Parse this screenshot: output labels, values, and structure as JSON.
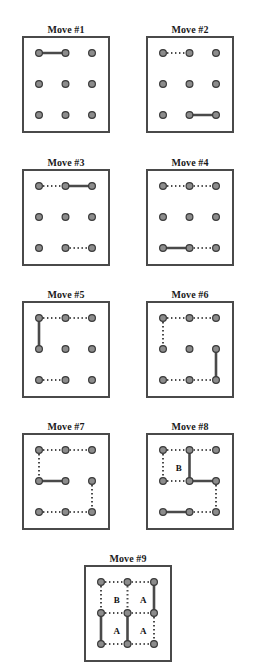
{
  "figure": {
    "type": "diagram",
    "grid_rows": 3,
    "grid_cols": 3,
    "colors": {
      "frame": "#4a4a4a",
      "dot_fill": "#8c8c8c",
      "dot_stroke": "#3a3a3a",
      "solid_line": "#4a4a4a",
      "dotted_line": "#4a4a4a",
      "label_text": "#111111",
      "background": "#ffffff"
    },
    "legend": {
      "solid_meaning": "edge drawn on this move",
      "dotted_meaning": "edge drawn on a previous move"
    }
  },
  "panels": [
    {
      "id": "move-1",
      "title": "Move #1",
      "x": 22,
      "y": 24,
      "width": 88,
      "height": 97,
      "solid_edges": [
        {
          "from": [
            0,
            0
          ],
          "to": [
            1,
            0
          ]
        }
      ],
      "dotted_edges": [],
      "labels": []
    },
    {
      "id": "move-2",
      "title": "Move #2",
      "x": 146,
      "y": 24,
      "width": 88,
      "height": 97,
      "solid_edges": [
        {
          "from": [
            1,
            2
          ],
          "to": [
            2,
            2
          ]
        }
      ],
      "dotted_edges": [
        {
          "from": [
            0,
            0
          ],
          "to": [
            1,
            0
          ]
        }
      ],
      "labels": []
    },
    {
      "id": "move-3",
      "title": "Move #3",
      "x": 22,
      "y": 157,
      "width": 88,
      "height": 97,
      "solid_edges": [
        {
          "from": [
            1,
            0
          ],
          "to": [
            2,
            0
          ]
        }
      ],
      "dotted_edges": [
        {
          "from": [
            0,
            0
          ],
          "to": [
            1,
            0
          ]
        },
        {
          "from": [
            1,
            2
          ],
          "to": [
            2,
            2
          ]
        }
      ],
      "labels": []
    },
    {
      "id": "move-4",
      "title": "Move #4",
      "x": 146,
      "y": 157,
      "width": 88,
      "height": 97,
      "solid_edges": [
        {
          "from": [
            0,
            2
          ],
          "to": [
            1,
            2
          ]
        }
      ],
      "dotted_edges": [
        {
          "from": [
            0,
            0
          ],
          "to": [
            1,
            0
          ]
        },
        {
          "from": [
            1,
            0
          ],
          "to": [
            2,
            0
          ]
        },
        {
          "from": [
            1,
            2
          ],
          "to": [
            2,
            2
          ]
        }
      ],
      "labels": []
    },
    {
      "id": "move-5",
      "title": "Move #5",
      "x": 22,
      "y": 289,
      "width": 88,
      "height": 97,
      "solid_edges": [
        {
          "from": [
            0,
            0
          ],
          "to": [
            0,
            1
          ]
        }
      ],
      "dotted_edges": [
        {
          "from": [
            0,
            0
          ],
          "to": [
            1,
            0
          ]
        },
        {
          "from": [
            1,
            0
          ],
          "to": [
            2,
            0
          ]
        },
        {
          "from": [
            0,
            2
          ],
          "to": [
            1,
            2
          ]
        }
      ],
      "labels": []
    },
    {
      "id": "move-6",
      "title": "Move #6",
      "x": 146,
      "y": 289,
      "width": 88,
      "height": 97,
      "solid_edges": [
        {
          "from": [
            2,
            1
          ],
          "to": [
            2,
            2
          ]
        }
      ],
      "dotted_edges": [
        {
          "from": [
            0,
            0
          ],
          "to": [
            1,
            0
          ]
        },
        {
          "from": [
            1,
            0
          ],
          "to": [
            2,
            0
          ]
        },
        {
          "from": [
            0,
            0
          ],
          "to": [
            0,
            1
          ]
        },
        {
          "from": [
            0,
            2
          ],
          "to": [
            1,
            2
          ]
        },
        {
          "from": [
            1,
            2
          ],
          "to": [
            2,
            2
          ]
        }
      ],
      "labels": []
    },
    {
      "id": "move-7",
      "title": "Move #7",
      "x": 22,
      "y": 421,
      "width": 88,
      "height": 97,
      "solid_edges": [
        {
          "from": [
            0,
            1
          ],
          "to": [
            1,
            1
          ]
        }
      ],
      "dotted_edges": [
        {
          "from": [
            0,
            0
          ],
          "to": [
            1,
            0
          ]
        },
        {
          "from": [
            1,
            0
          ],
          "to": [
            2,
            0
          ]
        },
        {
          "from": [
            0,
            0
          ],
          "to": [
            0,
            1
          ]
        },
        {
          "from": [
            2,
            1
          ],
          "to": [
            2,
            2
          ]
        },
        {
          "from": [
            0,
            2
          ],
          "to": [
            1,
            2
          ]
        },
        {
          "from": [
            1,
            2
          ],
          "to": [
            2,
            2
          ]
        }
      ],
      "labels": []
    },
    {
      "id": "move-8",
      "title": "Move #8",
      "x": 146,
      "y": 421,
      "width": 88,
      "height": 97,
      "solid_edges": [
        {
          "from": [
            1,
            0
          ],
          "to": [
            1,
            1
          ]
        },
        {
          "from": [
            1,
            1
          ],
          "to": [
            2,
            1
          ]
        },
        {
          "from": [
            0,
            2
          ],
          "to": [
            1,
            2
          ]
        }
      ],
      "dotted_edges": [
        {
          "from": [
            0,
            0
          ],
          "to": [
            1,
            0
          ]
        },
        {
          "from": [
            1,
            0
          ],
          "to": [
            2,
            0
          ]
        },
        {
          "from": [
            0,
            0
          ],
          "to": [
            0,
            1
          ]
        },
        {
          "from": [
            0,
            1
          ],
          "to": [
            1,
            1
          ]
        },
        {
          "from": [
            2,
            1
          ],
          "to": [
            2,
            2
          ]
        },
        {
          "from": [
            1,
            2
          ],
          "to": [
            2,
            2
          ]
        }
      ],
      "labels": [
        {
          "text": "B",
          "cell": [
            0,
            0
          ]
        }
      ]
    },
    {
      "id": "move-9",
      "title": "Move #9",
      "x": 84,
      "y": 553,
      "width": 88,
      "height": 97,
      "solid_edges": [
        {
          "from": [
            2,
            0
          ],
          "to": [
            2,
            1
          ]
        },
        {
          "from": [
            0,
            1
          ],
          "to": [
            0,
            2
          ]
        },
        {
          "from": [
            1,
            1
          ],
          "to": [
            1,
            2
          ]
        }
      ],
      "dotted_edges": [
        {
          "from": [
            0,
            0
          ],
          "to": [
            1,
            0
          ]
        },
        {
          "from": [
            1,
            0
          ],
          "to": [
            2,
            0
          ]
        },
        {
          "from": [
            0,
            0
          ],
          "to": [
            0,
            1
          ]
        },
        {
          "from": [
            1,
            0
          ],
          "to": [
            1,
            1
          ]
        },
        {
          "from": [
            0,
            1
          ],
          "to": [
            1,
            1
          ]
        },
        {
          "from": [
            1,
            1
          ],
          "to": [
            2,
            1
          ]
        },
        {
          "from": [
            2,
            1
          ],
          "to": [
            2,
            2
          ]
        },
        {
          "from": [
            0,
            2
          ],
          "to": [
            1,
            2
          ]
        },
        {
          "from": [
            1,
            2
          ],
          "to": [
            2,
            2
          ]
        }
      ],
      "labels": [
        {
          "text": "B",
          "cell": [
            0,
            0
          ]
        },
        {
          "text": "A",
          "cell": [
            1,
            0
          ]
        },
        {
          "text": "A",
          "cell": [
            0,
            1
          ]
        },
        {
          "text": "A",
          "cell": [
            1,
            1
          ]
        }
      ]
    }
  ]
}
